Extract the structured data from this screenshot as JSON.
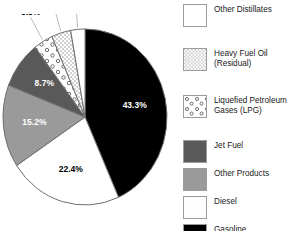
{
  "chart_data": {
    "type": "pie",
    "title": "",
    "xlabel": "",
    "ylabel": "",
    "unit": "%",
    "legend_position": "right",
    "grid": false,
    "start_angle_deg": 0,
    "direction": "clockwise",
    "categories": [
      "Gasoline",
      "Diesel",
      "Other Products",
      "Jet Fuel",
      "Liquefied Petroleum Gases (LPG)",
      "Heavy Fuel Oil (Residual)",
      "Other Distillates"
    ],
    "values": [
      43.3,
      22.4,
      15.2,
      8.7,
      3.8,
      3.8,
      2.8
    ],
    "slices": [
      {
        "name": "Gasoline",
        "value": 43.3,
        "label": "43.3%",
        "fill": "#000000",
        "label_color": "#ffffff",
        "pattern": "solid"
      },
      {
        "name": "Diesel",
        "value": 22.4,
        "label": "22.4%",
        "fill": "#ffffff",
        "label_color": "#000000",
        "pattern": "solid"
      },
      {
        "name": "Other Products",
        "value": 15.2,
        "label": "15.2%",
        "fill": "#9a9a9a",
        "label_color": "#ffffff",
        "pattern": "solid"
      },
      {
        "name": "Jet Fuel",
        "value": 8.7,
        "label": "8.7%",
        "fill": "#595959",
        "label_color": "#ffffff",
        "pattern": "solid"
      },
      {
        "name": "Liquefied Petroleum Gases (LPG)",
        "value": 3.8,
        "label": "3.8%",
        "fill": "#ffffff",
        "label_color": "#000000",
        "pattern": "circles"
      },
      {
        "name": "Heavy Fuel Oil (Residual)",
        "value": 3.8,
        "label": "3.8%",
        "fill": "#ffffff",
        "label_color": "#000000",
        "pattern": "dots"
      },
      {
        "name": "Other Distillates",
        "value": 2.8,
        "label": "2.8%",
        "fill": "#ffffff",
        "label_color": "#000000",
        "pattern": "solid"
      }
    ]
  },
  "legend": {
    "items": [
      {
        "label": "Other Distillates",
        "pattern": "solid",
        "fill": "#ffffff"
      },
      {
        "label": "Heavy Fuel Oil\n(Residual)",
        "pattern": "dots",
        "fill": "#ffffff"
      },
      {
        "label": "Liquefied Petroleum\nGases (LPG)",
        "pattern": "circles",
        "fill": "#ffffff"
      },
      {
        "label": "Jet Fuel",
        "pattern": "solid",
        "fill": "#595959"
      },
      {
        "label": "Other Products",
        "pattern": "solid",
        "fill": "#9a9a9a"
      },
      {
        "label": "Diesel",
        "pattern": "solid",
        "fill": "#fdfdfd"
      },
      {
        "label": "Gasoline",
        "pattern": "solid",
        "fill": "#000000"
      }
    ]
  },
  "colors": {
    "outline": "#6f6f6f",
    "text": "#1a1a1a",
    "background": "#ffffff"
  }
}
